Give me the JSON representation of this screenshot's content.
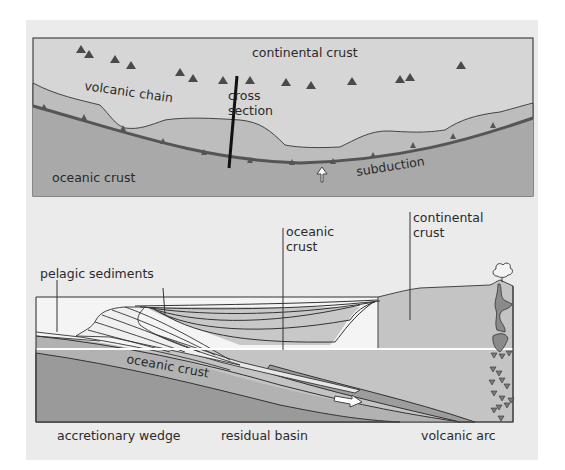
{
  "figure": {
    "top_panel": {
      "title": "map view",
      "labels": {
        "continental_crust": "continental crust",
        "volcanic_chain": "volcanic chain",
        "cross_section_line1": "cross",
        "cross_section_line2": "section",
        "oceanic_crust": "oceanic crust",
        "subduction": "subduction"
      },
      "volcano_count": 17
    },
    "bottom_panel": {
      "title": "cross section",
      "labels": {
        "pelagic_sediments": "pelagic sediments",
        "oceanic_crust_top_line1": "oceanic",
        "oceanic_crust_top_line2": "crust",
        "continental_crust_line1": "continental",
        "continental_crust_line2": "crust",
        "oceanic_crust_slab": "oceanic crust",
        "accretionary_wedge": "accretionary wedge",
        "residual_basin": "residual basin",
        "volcanic_arc": "volcanic arc"
      }
    },
    "colors": {
      "background": "#ebebeb",
      "continental_light": "#d6d6d6",
      "forearc_mid": "#bdbdbd",
      "oceanic": "#a9a9a9",
      "oceanic_dark": "#8f8f8f",
      "sediment_light": "#f2f2f2",
      "line": "#333333",
      "volcano": "#4a4a4a"
    }
  }
}
